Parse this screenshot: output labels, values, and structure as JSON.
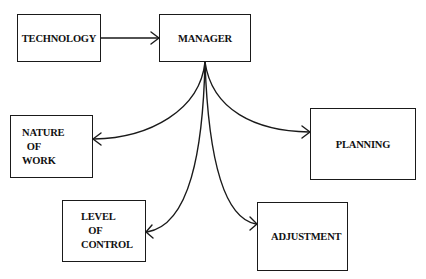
{
  "diagram": {
    "type": "flow",
    "colors": {
      "stroke": "#1a1a1a",
      "text": "#111111",
      "background": "#ffffff"
    },
    "nodes": {
      "technology": {
        "label": "TECHNOLOGY"
      },
      "manager": {
        "label": "MANAGER"
      },
      "nature_of_work": {
        "lines": [
          "NATURE",
          "  OF",
          "WORK"
        ]
      },
      "planning": {
        "label": "PLANNING"
      },
      "level_of_control": {
        "lines": [
          "LEVEL",
          "   OF",
          "CONTROL"
        ]
      },
      "adjustment": {
        "label": "ADJUSTMENT"
      }
    },
    "edges": [
      {
        "from": "technology",
        "to": "manager",
        "style": "straight"
      },
      {
        "from": "manager",
        "to": "nature_of_work",
        "style": "curved"
      },
      {
        "from": "manager",
        "to": "planning",
        "style": "curved"
      },
      {
        "from": "manager",
        "to": "level_of_control",
        "style": "curved"
      },
      {
        "from": "manager",
        "to": "adjustment",
        "style": "curved"
      }
    ]
  }
}
